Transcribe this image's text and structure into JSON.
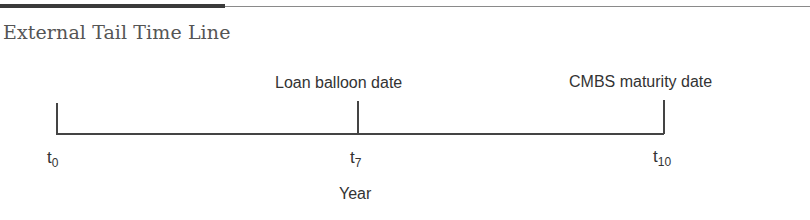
{
  "figure": {
    "title": "External Tail Time Line",
    "axis_label": "Year",
    "events": [
      {
        "label": "",
        "tick_base": "t",
        "tick_sub": "0"
      },
      {
        "label": "Loan balloon date",
        "tick_base": "t",
        "tick_sub": "7"
      },
      {
        "label": "CMBS maturity date",
        "tick_base": "t",
        "tick_sub": "10"
      }
    ]
  },
  "colors": {
    "line": "#444444",
    "title": "#555555",
    "text": "#333333"
  }
}
